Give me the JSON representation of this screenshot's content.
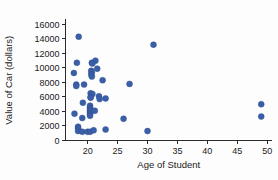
{
  "chart_data": {
    "type": "scatter",
    "title": "",
    "xlabel": "Age of Student",
    "ylabel": "Value of Car (dollars)",
    "xlim": [
      16.3,
      50.8
    ],
    "ylim": [
      0,
      16600
    ],
    "xticks": [
      20,
      25,
      30,
      35,
      40,
      45,
      50
    ],
    "xtick_labels": [
      "20",
      "25",
      "30",
      "35",
      "40",
      "45",
      "50"
    ],
    "yticks": [
      0,
      2000,
      4000,
      6000,
      8000,
      10000,
      12000,
      14000,
      16000
    ],
    "ytick_labels": [
      "0",
      "2000",
      "4000",
      "6000",
      "8000",
      "10000",
      "12000",
      "14000",
      "16000"
    ],
    "grid": false,
    "legend": false,
    "marker_color": "#3a5fa8",
    "marker_size": 3.0,
    "points": [
      {
        "x": 18.5,
        "y": 14300
      },
      {
        "x": 31.0,
        "y": 13200
      },
      {
        "x": 21.3,
        "y": 11000
      },
      {
        "x": 20.7,
        "y": 10700
      },
      {
        "x": 18.2,
        "y": 10700
      },
      {
        "x": 20.8,
        "y": 10600
      },
      {
        "x": 21.6,
        "y": 9900
      },
      {
        "x": 20.6,
        "y": 9600
      },
      {
        "x": 20.7,
        "y": 9400
      },
      {
        "x": 17.7,
        "y": 9300
      },
      {
        "x": 20.6,
        "y": 9100
      },
      {
        "x": 20.7,
        "y": 8800
      },
      {
        "x": 22.5,
        "y": 8300
      },
      {
        "x": 27.0,
        "y": 7800
      },
      {
        "x": 19.4,
        "y": 7700
      },
      {
        "x": 18.1,
        "y": 7700
      },
      {
        "x": 18.1,
        "y": 7500
      },
      {
        "x": 20.5,
        "y": 6500
      },
      {
        "x": 20.8,
        "y": 6400
      },
      {
        "x": 21.9,
        "y": 6100
      },
      {
        "x": 20.5,
        "y": 6000
      },
      {
        "x": 20.5,
        "y": 5900
      },
      {
        "x": 23.0,
        "y": 5800
      },
      {
        "x": 22.0,
        "y": 5700
      },
      {
        "x": 49.0,
        "y": 5000
      },
      {
        "x": 19.2,
        "y": 5200
      },
      {
        "x": 20.4,
        "y": 4800
      },
      {
        "x": 20.4,
        "y": 4600
      },
      {
        "x": 20.4,
        "y": 4400
      },
      {
        "x": 20.4,
        "y": 4200
      },
      {
        "x": 20.4,
        "y": 4000
      },
      {
        "x": 20.4,
        "y": 3800
      },
      {
        "x": 20.4,
        "y": 3600
      },
      {
        "x": 20.4,
        "y": 3400
      },
      {
        "x": 17.8,
        "y": 3700
      },
      {
        "x": 21.2,
        "y": 4100
      },
      {
        "x": 49.0,
        "y": 3300
      },
      {
        "x": 19.1,
        "y": 3100
      },
      {
        "x": 26.0,
        "y": 3000
      },
      {
        "x": 18.4,
        "y": 1900
      },
      {
        "x": 18.4,
        "y": 1700
      },
      {
        "x": 18.4,
        "y": 1300
      },
      {
        "x": 19.1,
        "y": 1200
      },
      {
        "x": 20.0,
        "y": 1200
      },
      {
        "x": 20.4,
        "y": 1200
      },
      {
        "x": 21.0,
        "y": 1400
      },
      {
        "x": 23.0,
        "y": 1500
      },
      {
        "x": 30.0,
        "y": 1300
      }
    ]
  }
}
